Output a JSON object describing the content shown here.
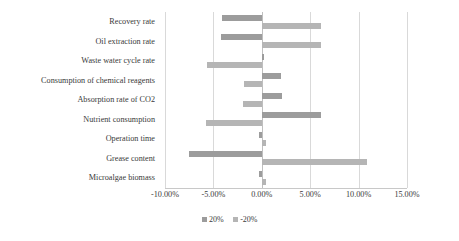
{
  "chart_data": {
    "type": "bar",
    "title": "",
    "subtitle": "",
    "xlabel": "",
    "ylabel": "",
    "orientation": "horizontal",
    "style": "tornado",
    "grid": true,
    "legend_position": "bottom",
    "xlim": [
      -10,
      15
    ],
    "xticks": [
      -10,
      -5,
      0,
      5,
      10,
      15
    ],
    "xticklabels": [
      "-10.00%",
      "-5.00%",
      "0.00%",
      "5.00%",
      "10.00%",
      "15.00%"
    ],
    "categories": [
      "Recovery rate",
      "Oil extraction rate",
      "Waste water cycle rate",
      "Consumption of chemical reagents",
      "Absorption rate of CO2",
      "Nutrient consumption",
      "Operation time",
      "Grease content",
      "Microalgae biomass"
    ],
    "series": [
      {
        "name": "20%",
        "color": "#9c9c9c",
        "values": [
          -4.1,
          -4.2,
          0.25,
          2.0,
          2.1,
          6.1,
          -0.3,
          -7.5,
          -0.3
        ]
      },
      {
        "name": "-20%",
        "color": "#b5b5b5",
        "values": [
          6.1,
          6.1,
          -5.7,
          -1.8,
          -1.9,
          -5.8,
          0.4,
          10.9,
          0.45
        ]
      }
    ]
  },
  "legend": {
    "items": [
      {
        "label": "20%",
        "color": "#9c9c9c"
      },
      {
        "label": "-20%",
        "color": "#b5b5b5"
      }
    ]
  },
  "colors": {
    "background": "#ffffff",
    "gridline": "#d9d9d9",
    "axis": "#c8c8c8",
    "text": "#3a3a3a",
    "series_20": "#9c9c9c",
    "series_neg20": "#b5b5b5"
  }
}
